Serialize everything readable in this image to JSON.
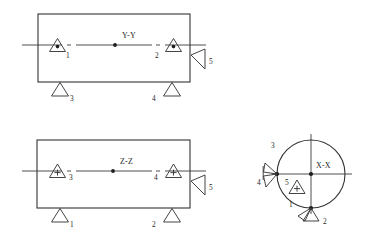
{
  "diagram": {
    "type": "engineering-section-views",
    "views": [
      {
        "id": "view-yy",
        "section_label": "Y-Y",
        "shape": "rectangle",
        "internal_markers": [
          {
            "label": "1",
            "symbol": "triangle-with-dot"
          },
          {
            "label": "2",
            "symbol": "triangle-with-dot"
          }
        ],
        "support_markers": [
          {
            "label": "3",
            "symbol": "triangle-support"
          },
          {
            "label": "4",
            "symbol": "triangle-support"
          }
        ],
        "edge_markers": [
          {
            "label": "5",
            "symbol": "wedge-arrow-left"
          }
        ]
      },
      {
        "id": "view-zz",
        "section_label": "Z-Z",
        "shape": "rectangle",
        "internal_markers": [
          {
            "label": "3",
            "symbol": "triangle-with-plus"
          },
          {
            "label": "4",
            "symbol": "triangle-with-plus"
          }
        ],
        "support_markers": [
          {
            "label": "1",
            "symbol": "triangle-support"
          },
          {
            "label": "2",
            "symbol": "triangle-support"
          }
        ],
        "edge_markers": [
          {
            "label": "5",
            "symbol": "wedge-arrow-left"
          }
        ]
      },
      {
        "id": "view-xx",
        "section_label": "X-X",
        "shape": "circle",
        "internal_markers": [
          {
            "label": "5",
            "symbol": "triangle-with-plus"
          }
        ],
        "edge_markers": [
          {
            "label": "3",
            "symbol": "wedge-upper-left"
          },
          {
            "label": "4",
            "symbol": "wedge-lower-left"
          },
          {
            "label": "1",
            "symbol": "wedge-lower-left-bottom"
          },
          {
            "label": "2",
            "symbol": "wedge-lower-right-bottom"
          }
        ]
      }
    ],
    "labels": {
      "yy": "Y-Y",
      "zz": "Z-Z",
      "xx": "X-X",
      "yy_left": "1",
      "yy_right": "2",
      "yy_support_left": "3",
      "yy_support_right": "4",
      "yy_edge": "5",
      "zz_left": "3",
      "zz_right": "4",
      "zz_support_left": "1",
      "zz_support_right": "2",
      "zz_edge": "5",
      "xx_top_left": "3",
      "xx_left": "4",
      "xx_inner": "5",
      "xx_bottom_left": "1",
      "xx_bottom_right": "2"
    },
    "colors": {
      "stroke": "#333333",
      "text": "#1f1f1f",
      "background": "#ffffff"
    }
  }
}
